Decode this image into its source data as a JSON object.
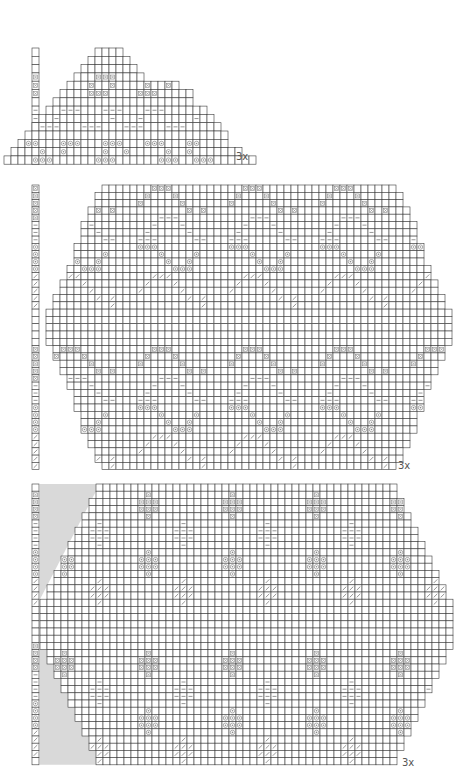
{
  "document": {
    "type": "knitting-stitch-charts",
    "legend": {
      "x": "cross/bobble stitch",
      "-": "purl stitch",
      "o": "yarn over",
      "/": "slant stitch",
      " ": "knit stitch"
    }
  },
  "charts": [
    {
      "id": "chart-1",
      "repeat_label": "3x",
      "key_column": [
        "",
        "",
        "",
        "x",
        "x",
        "x",
        "",
        "-",
        "-",
        "-",
        "",
        "o",
        "o",
        "o"
      ],
      "rows": [
        {
          "start": 14,
          "cells": "    "
        },
        {
          "start": 13,
          "cells": "      "
        },
        {
          "start": 12,
          "cells": "        "
        },
        {
          "start": 11,
          "cells": "   xxx    "
        },
        {
          "start": 10,
          "cells": "   x  x    x  x "
        },
        {
          "start": 9,
          "cells": "    xxx    xxx     "
        },
        {
          "start": 8,
          "cells": "                    "
        },
        {
          "start": 7,
          "cells": "  ---   ---   ---      "
        },
        {
          "start": 6,
          "cells": "  -       -   -       -  "
        },
        {
          "start": 5,
          "cells": " ---   ---   ---   ---     "
        },
        {
          "start": 4,
          "cells": "                             "
        },
        {
          "start": 3,
          "cells": " oo   ooo   ooo   ooo   oo    "
        },
        {
          "start": 2,
          "cells": "    o  o     o  o     o  o       "
        },
        {
          "start": 1,
          "cells": "    ooo      ooo      ooo  ooo      "
        }
      ]
    },
    {
      "id": "chart-2",
      "repeat_label": "3x",
      "rows_summary": "mirrored diamond lace repeat, 2 repeats vertically",
      "key_column": [
        "x",
        "x",
        "x",
        "x",
        "x",
        "-",
        "-",
        "-",
        "o",
        "o",
        "o",
        "o",
        "/",
        "/",
        "/",
        "/",
        "/",
        "",
        "",
        "",
        "",
        "",
        "x",
        "x",
        "x",
        "x",
        "x",
        "-",
        "-",
        "-",
        "o",
        "o",
        "o",
        "o",
        "/",
        "/",
        "/",
        "/",
        "/"
      ]
    },
    {
      "id": "chart-3",
      "repeat_label": "3x",
      "rows_summary": "allover block lace repeat with shaded selvedge area",
      "key_column": [
        "",
        "x",
        "x",
        "x",
        "x",
        "-",
        "-",
        "-",
        "-",
        "o",
        "o",
        "o",
        "o",
        "/",
        "/",
        "/",
        "/",
        "",
        "",
        "",
        "",
        "",
        "x",
        "x",
        "x",
        "x",
        "-",
        "-",
        "-",
        "-",
        "o",
        "o",
        "o",
        "o",
        "/",
        "/",
        "/",
        "/",
        ""
      ]
    }
  ],
  "colors": {
    "grid_line": "#3a3a3a",
    "symbol": "#8a8a8a",
    "shade": "#d9d9d9",
    "background": "#ffffff"
  }
}
